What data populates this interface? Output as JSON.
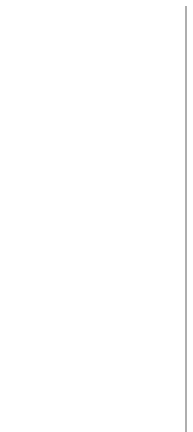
{
  "diagram": {
    "type": "flowchart",
    "nodes": [
      {
        "id": "start",
        "shape": "ellipse",
        "label": "START",
        "shaded": false
      },
      {
        "id": "read",
        "shape": "rect",
        "label": "read(x,y,z)",
        "shaded": false
      },
      {
        "id": "m0",
        "shape": "rect",
        "label": "m0 := true",
        "shaded": true
      },
      {
        "id": "d1",
        "shape": "diamond",
        "label": "x ≥ y",
        "shaded": false
      },
      {
        "id": "m1",
        "shape": "rect",
        "label": "m1 := true",
        "shaded": true
      },
      {
        "id": "maxx",
        "shape": "rect",
        "label": "max := x",
        "shaded": false
      },
      {
        "id": "m2",
        "shape": "rect",
        "label": "m2 := true",
        "shaded": true
      },
      {
        "id": "m3",
        "shape": "rect",
        "label": "m3 := true",
        "shaded": true
      },
      {
        "id": "maxy1",
        "shape": "rect",
        "label": "max := y",
        "shaded": false
      },
      {
        "id": "m4",
        "shape": "rect",
        "label": "m4 := true",
        "shaded": true
      },
      {
        "id": "d2",
        "shape": "diamond",
        "label": "z ≥ max",
        "shaded": false
      },
      {
        "id": "m5",
        "shape": "rect",
        "label": "m5 := true",
        "shaded": true
      },
      {
        "id": "maxz",
        "shape": "rect",
        "label": "max := z",
        "shaded": false
      },
      {
        "id": "m6",
        "shape": "rect",
        "label": "m6 := true",
        "shaded": true
      },
      {
        "id": "m7",
        "shape": "rect",
        "label": "m7 := true",
        "shaded": true
      },
      {
        "id": "maxy2",
        "shape": "rect",
        "label": "max := y",
        "shaded": false
      },
      {
        "id": "m8",
        "shape": "rect",
        "label": "m8 := true",
        "shaded": true
      },
      {
        "id": "write",
        "shape": "rect",
        "label": "write(max)",
        "shaded": false
      },
      {
        "id": "stop",
        "shape": "ellipse",
        "label": "STOP",
        "shaded": false
      }
    ],
    "edges": [
      {
        "from": "start",
        "to": "read",
        "label": ""
      },
      {
        "from": "read",
        "to": "m0",
        "label": ""
      },
      {
        "from": "m0",
        "to": "d1",
        "label": ""
      },
      {
        "from": "d1",
        "to": "m1",
        "label": "w"
      },
      {
        "from": "d1",
        "to": "m3",
        "label": "f"
      },
      {
        "from": "m1",
        "to": "maxx",
        "label": ""
      },
      {
        "from": "maxx",
        "to": "m2",
        "label": ""
      },
      {
        "from": "m3",
        "to": "maxy1",
        "label": ""
      },
      {
        "from": "maxy1",
        "to": "m4",
        "label": ""
      },
      {
        "from": "m2",
        "to": "d2",
        "label": ""
      },
      {
        "from": "m4",
        "to": "d2",
        "label": ""
      },
      {
        "from": "d2",
        "to": "m5",
        "label": "w"
      },
      {
        "from": "d2",
        "to": "m7",
        "label": "f"
      },
      {
        "from": "m5",
        "to": "maxz",
        "label": ""
      },
      {
        "from": "maxz",
        "to": "m6",
        "label": ""
      },
      {
        "from": "m7",
        "to": "maxy2",
        "label": ""
      },
      {
        "from": "maxy2",
        "to": "m8",
        "label": ""
      },
      {
        "from": "m6",
        "to": "write",
        "label": ""
      },
      {
        "from": "m8",
        "to": "write",
        "label": ""
      },
      {
        "from": "write",
        "to": "stop",
        "label": ""
      }
    ],
    "branch_labels": {
      "true": "w",
      "false": "f"
    }
  }
}
